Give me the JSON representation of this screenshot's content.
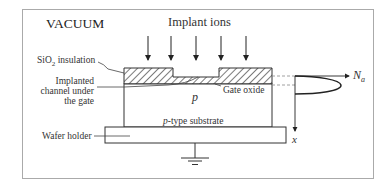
{
  "diagram": {
    "title": "VACUUM",
    "implant_label": "Implant ions",
    "labels": {
      "sio2_prefix": "SiO",
      "sio2_sub": "2",
      "sio2_suffix": " insulation",
      "channel_line1": "Implanted",
      "channel_line2": "channel under",
      "channel_line3": "the gate",
      "gate_oxide": "Gate oxide",
      "p_region": "p",
      "substrate_italic": "p",
      "substrate_rest": "-type substrate",
      "wafer_holder": "Wafer holder"
    },
    "profile": {
      "x_axis_label_main": "N",
      "x_axis_label_sub": "a",
      "y_axis_label": "x"
    },
    "arrow_count": 5,
    "colors": {
      "line": "#333333",
      "border": "#999999",
      "background": "#ffffff"
    }
  }
}
